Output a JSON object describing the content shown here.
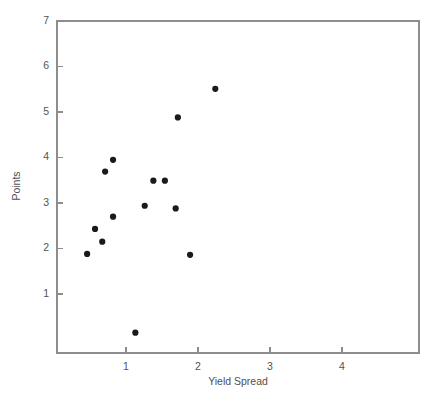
{
  "chart_data": {
    "type": "scatter",
    "title": "",
    "xlabel": "Yield Spread",
    "ylabel": "Points",
    "xlim": [
      0.17,
      4.8
    ],
    "ylim": [
      -0.45,
      7.0
    ],
    "xticks": [
      1,
      2,
      3,
      4
    ],
    "yticks": [
      1,
      2,
      3,
      4,
      5,
      6,
      7
    ],
    "xtick_labels": [
      "1",
      "2",
      "3",
      "4"
    ],
    "ytick_labels": [
      "1",
      "2",
      "3",
      "4",
      "5",
      "6",
      "7"
    ],
    "grid": false,
    "legend": null,
    "marker": "filled-circle",
    "marker_color": "#1a1a1a",
    "marker_size": 3.1,
    "points": [
      {
        "x": 0.46,
        "y": 1.88
      },
      {
        "x": 0.57,
        "y": 2.43
      },
      {
        "x": 0.67,
        "y": 2.15
      },
      {
        "x": 0.71,
        "y": 3.69
      },
      {
        "x": 0.82,
        "y": 3.95
      },
      {
        "x": 0.82,
        "y": 2.7
      },
      {
        "x": 1.13,
        "y": 0.15
      },
      {
        "x": 1.26,
        "y": 2.94
      },
      {
        "x": 1.38,
        "y": 3.49
      },
      {
        "x": 1.54,
        "y": 3.49
      },
      {
        "x": 1.69,
        "y": 2.88
      },
      {
        "x": 1.72,
        "y": 4.88
      },
      {
        "x": 1.89,
        "y": 1.86
      },
      {
        "x": 2.24,
        "y": 5.51
      }
    ]
  },
  "frame": {
    "left_px": 57,
    "right_px": 419,
    "top_px": 21,
    "bottom_px": 353,
    "x_origin_px": 126,
    "x_unit_px": 72,
    "y_origin_px": 21,
    "y_unit_px": 45.5,
    "y_origin_value": 7
  },
  "labels": {
    "x_axis_title": "Yield Spread",
    "y_axis_title": "Points"
  }
}
